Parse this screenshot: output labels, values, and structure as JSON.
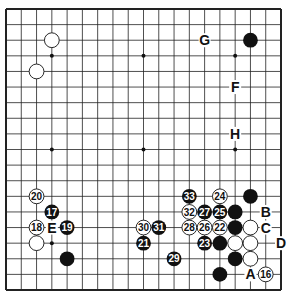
{
  "diagram": {
    "type": "go-board",
    "size": 19,
    "colors": {
      "background": "#ffffff",
      "line": "#222222",
      "black_stone": "#111111",
      "white_stone": "#ffffff"
    },
    "star_points": [
      [
        3,
        3
      ],
      [
        9,
        3
      ],
      [
        15,
        3
      ],
      [
        3,
        9
      ],
      [
        9,
        9
      ],
      [
        15,
        9
      ],
      [
        3,
        15
      ],
      [
        9,
        15
      ],
      [
        15,
        15
      ]
    ],
    "stones": [
      {
        "color": "white",
        "col": 3,
        "row": 2,
        "label": ""
      },
      {
        "color": "white",
        "col": 2,
        "row": 4,
        "label": ""
      },
      {
        "color": "black",
        "col": 16,
        "row": 2,
        "label": ""
      },
      {
        "color": "white",
        "col": 2,
        "row": 12,
        "label": "20"
      },
      {
        "color": "black",
        "col": 3,
        "row": 13,
        "label": "17"
      },
      {
        "color": "white",
        "col": 2,
        "row": 14,
        "label": "18"
      },
      {
        "color": "black",
        "col": 4,
        "row": 14,
        "label": "19"
      },
      {
        "color": "white",
        "col": 2,
        "row": 15,
        "label": ""
      },
      {
        "color": "black",
        "col": 4,
        "row": 16,
        "label": ""
      },
      {
        "color": "white",
        "col": 9,
        "row": 14,
        "label": "30"
      },
      {
        "color": "black",
        "col": 10,
        "row": 14,
        "label": "31"
      },
      {
        "color": "black",
        "col": 9,
        "row": 15,
        "label": "21"
      },
      {
        "color": "black",
        "col": 11,
        "row": 16,
        "label": "29"
      },
      {
        "color": "black",
        "col": 12,
        "row": 12,
        "label": "33"
      },
      {
        "color": "white",
        "col": 14,
        "row": 12,
        "label": "24"
      },
      {
        "color": "black",
        "col": 16,
        "row": 12,
        "label": ""
      },
      {
        "color": "white",
        "col": 12,
        "row": 13,
        "label": "32"
      },
      {
        "color": "black",
        "col": 13,
        "row": 13,
        "label": "27"
      },
      {
        "color": "black",
        "col": 14,
        "row": 13,
        "label": "25"
      },
      {
        "color": "black",
        "col": 15,
        "row": 13,
        "label": ""
      },
      {
        "color": "white",
        "col": 12,
        "row": 14,
        "label": "28"
      },
      {
        "color": "white",
        "col": 13,
        "row": 14,
        "label": "26"
      },
      {
        "color": "white",
        "col": 14,
        "row": 14,
        "label": "22"
      },
      {
        "color": "black",
        "col": 15,
        "row": 14,
        "label": ""
      },
      {
        "color": "white",
        "col": 16,
        "row": 14,
        "label": ""
      },
      {
        "color": "black",
        "col": 13,
        "row": 15,
        "label": "23"
      },
      {
        "color": "black",
        "col": 14,
        "row": 15,
        "label": ""
      },
      {
        "color": "white",
        "col": 15,
        "row": 15,
        "label": ""
      },
      {
        "color": "white",
        "col": 16,
        "row": 15,
        "label": ""
      },
      {
        "color": "black",
        "col": 15,
        "row": 16,
        "label": ""
      },
      {
        "color": "white",
        "col": 16,
        "row": 16,
        "label": ""
      },
      {
        "color": "black",
        "col": 14,
        "row": 17,
        "label": ""
      },
      {
        "color": "white",
        "col": 17,
        "row": 17,
        "label": "16"
      }
    ],
    "letters": [
      {
        "text": "G",
        "col": 13,
        "row": 2
      },
      {
        "text": "F",
        "col": 15,
        "row": 5
      },
      {
        "text": "H",
        "col": 15,
        "row": 8
      },
      {
        "text": "E",
        "col": 3,
        "row": 14
      },
      {
        "text": "B",
        "col": 17,
        "row": 13
      },
      {
        "text": "C",
        "col": 17,
        "row": 14
      },
      {
        "text": "D",
        "col": 18,
        "row": 15
      },
      {
        "text": "A",
        "col": 16,
        "row": 17
      }
    ]
  }
}
